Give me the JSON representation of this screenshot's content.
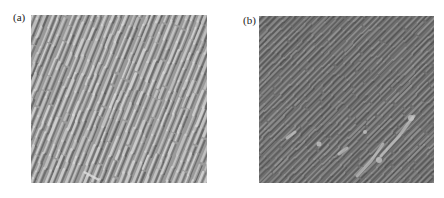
{
  "figure": {
    "panels": [
      {
        "label": "(a)",
        "description": "AFM-like surface image with dense steep diagonal ripple stripes",
        "stripe_angle_deg": 68,
        "tone": "medium gray"
      },
      {
        "label": "(b)",
        "description": "AFM-like surface image with fine 45-degree diagonal ripple stripes and bright streaks",
        "stripe_angle_deg": 45,
        "tone": "dark gray"
      }
    ],
    "colors": {
      "panel_a_base": "#9a9a9a",
      "panel_a_light": "#d8d8d8",
      "panel_a_dark": "#555555",
      "panel_b_base": "#6e6e6e",
      "panel_b_light": "#9c9c9c",
      "panel_b_dark": "#4a4a4a",
      "panel_b_highlight": "#c8c8c8"
    }
  }
}
